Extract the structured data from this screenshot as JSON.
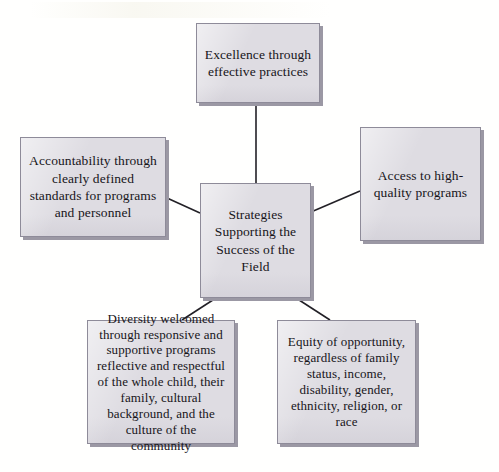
{
  "diagram": {
    "type": "hub-and-spoke",
    "center": {
      "id": "center",
      "label": "Strategies Supporting the Success of the Field"
    },
    "nodes": [
      {
        "id": "top",
        "label": "Excellence through effective practices",
        "position": "top"
      },
      {
        "id": "left",
        "label": "Accountability through clearly defined standards for programs and personnel",
        "position": "left"
      },
      {
        "id": "right",
        "label": "Access to high-quality programs",
        "position": "right"
      },
      {
        "id": "bottom-left",
        "label": "Diversity welcomed through responsive and supportive programs reflective and respectful of the whole child, their family, cultural background, and the culture of the community",
        "position": "bottom-left"
      },
      {
        "id": "bottom-right",
        "label": "Equity of opportunity, regardless of family status, income, disability, gender, ethnicity, religion, or race",
        "position": "bottom-right"
      }
    ],
    "connectors": [
      {
        "from": "center",
        "to": "top"
      },
      {
        "from": "center",
        "to": "left"
      },
      {
        "from": "center",
        "to": "right"
      },
      {
        "from": "center",
        "to": "bottom-left"
      },
      {
        "from": "center",
        "to": "bottom-right"
      }
    ],
    "colors": {
      "node_fill": "#dedce2",
      "node_border": "#8e8b99",
      "node_shadow": "#9b98a4",
      "connector": "#222026",
      "text": "#17151a",
      "page_background": "#ffffff"
    }
  }
}
